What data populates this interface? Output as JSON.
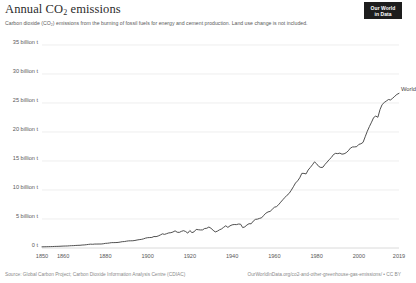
{
  "header": {
    "title_main": "Annual CO",
    "title_sub": "2",
    "title_tail": " emissions",
    "subtitle": "Carbon dioxide (CO₂) emissions from the burning of fossil fuels for energy and cement production. Land use change is not included."
  },
  "logo": {
    "line1": "Our World",
    "line2": "in Data",
    "background": "#1d1d1d",
    "text_color": "#ffffff"
  },
  "footer": {
    "source": "Source: Global Carbon Project; Carbon Dioxide Information Analysis Centre (CDIAC)",
    "url": "OurWorldInData.org/co2-and-other-greenhouse-gas-emissions/ • CC BY"
  },
  "series_label": "World",
  "colors": {
    "line": "#3c3c3c",
    "gridline": "#e6e6e6",
    "axis_text": "#595959",
    "title_text": "#2b2b2b",
    "subtitle_text": "#5b5b5b",
    "footer_text": "#8a8a8a",
    "background": "#ffffff"
  },
  "chart_data": {
    "type": "line",
    "title": "Annual CO2 emissions",
    "subtitle": "Carbon dioxide (CO₂) emissions from the burning of fossil fuels for energy and cement production. Land use change is not included.",
    "xlabel": "",
    "ylabel": "",
    "xlim": [
      1850,
      2019
    ],
    "ylim": [
      0,
      37
    ],
    "grid": true,
    "legend_position": "end-of-line",
    "y_ticks": [
      0,
      5,
      10,
      15,
      20,
      25,
      30,
      35
    ],
    "y_tick_labels": [
      "0 t",
      "5 billion t",
      "10 billion t",
      "15 billion t",
      "20 billion t",
      "25 billion t",
      "30 billion t",
      "35 billion t"
    ],
    "x_ticks": [
      1850,
      1860,
      1880,
      1900,
      1920,
      1940,
      1960,
      1980,
      2000,
      2019
    ],
    "x_tick_labels": [
      "1850",
      "1860",
      "1880",
      "1900",
      "1920",
      "1940",
      "1960",
      "1980",
      "2000",
      "2019"
    ],
    "unit": "billion tonnes",
    "series": [
      {
        "name": "World",
        "color": "#3c3c3c",
        "x": [
          1850,
          1851,
          1852,
          1853,
          1854,
          1855,
          1856,
          1857,
          1858,
          1859,
          1860,
          1861,
          1862,
          1863,
          1864,
          1865,
          1866,
          1867,
          1868,
          1869,
          1870,
          1871,
          1872,
          1873,
          1874,
          1875,
          1876,
          1877,
          1878,
          1879,
          1880,
          1881,
          1882,
          1883,
          1884,
          1885,
          1886,
          1887,
          1888,
          1889,
          1890,
          1891,
          1892,
          1893,
          1894,
          1895,
          1896,
          1897,
          1898,
          1899,
          1900,
          1901,
          1902,
          1903,
          1904,
          1905,
          1906,
          1907,
          1908,
          1909,
          1910,
          1911,
          1912,
          1913,
          1914,
          1915,
          1916,
          1917,
          1918,
          1919,
          1920,
          1921,
          1922,
          1923,
          1924,
          1925,
          1926,
          1927,
          1928,
          1929,
          1930,
          1931,
          1932,
          1933,
          1934,
          1935,
          1936,
          1937,
          1938,
          1939,
          1940,
          1941,
          1942,
          1943,
          1944,
          1945,
          1946,
          1947,
          1948,
          1949,
          1950,
          1951,
          1952,
          1953,
          1954,
          1955,
          1956,
          1957,
          1958,
          1959,
          1960,
          1961,
          1962,
          1963,
          1964,
          1965,
          1966,
          1967,
          1968,
          1969,
          1970,
          1971,
          1972,
          1973,
          1974,
          1975,
          1976,
          1977,
          1978,
          1979,
          1980,
          1981,
          1982,
          1983,
          1984,
          1985,
          1986,
          1987,
          1988,
          1989,
          1990,
          1991,
          1992,
          1993,
          1994,
          1995,
          1996,
          1997,
          1998,
          1999,
          2000,
          2001,
          2002,
          2003,
          2004,
          2005,
          2006,
          2007,
          2008,
          2009,
          2010,
          2011,
          2012,
          2013,
          2014,
          2015,
          2016,
          2017,
          2018,
          2019
        ],
        "values": [
          0.2,
          0.21,
          0.22,
          0.23,
          0.24,
          0.25,
          0.27,
          0.28,
          0.29,
          0.31,
          0.33,
          0.34,
          0.35,
          0.38,
          0.4,
          0.41,
          0.44,
          0.46,
          0.47,
          0.51,
          0.53,
          0.57,
          0.62,
          0.66,
          0.64,
          0.68,
          0.68,
          0.69,
          0.69,
          0.73,
          0.8,
          0.82,
          0.87,
          0.93,
          0.93,
          0.94,
          0.96,
          1.02,
          1.09,
          1.11,
          1.18,
          1.23,
          1.24,
          1.25,
          1.3,
          1.38,
          1.44,
          1.48,
          1.57,
          1.7,
          1.78,
          1.8,
          1.82,
          1.98,
          1.96,
          2.07,
          2.24,
          2.44,
          2.35,
          2.47,
          2.6,
          2.64,
          2.76,
          2.96,
          2.72,
          2.69,
          2.87,
          2.99,
          2.84,
          2.56,
          3.01,
          2.65,
          2.79,
          3.21,
          3.15,
          3.11,
          3.12,
          3.36,
          3.4,
          3.62,
          3.4,
          3.06,
          2.77,
          2.9,
          3.13,
          3.29,
          3.57,
          3.83,
          3.55,
          3.82,
          3.99,
          4.05,
          4.03,
          4.13,
          4.11,
          3.52,
          3.64,
          3.96,
          4.19,
          4.17,
          4.63,
          4.93,
          4.98,
          5.11,
          5.22,
          5.64,
          6.0,
          6.22,
          6.31,
          6.67,
          7.02,
          7.13,
          7.46,
          7.9,
          8.32,
          8.72,
          9.1,
          9.41,
          9.96,
          10.56,
          11.2,
          11.57,
          12.1,
          12.87,
          12.86,
          12.77,
          13.45,
          13.88,
          14.34,
          14.85,
          14.52,
          14.06,
          13.88,
          13.93,
          14.43,
          14.82,
          15.26,
          15.61,
          16.12,
          16.32,
          16.27,
          16.36,
          16.18,
          16.24,
          16.43,
          16.76,
          17.22,
          17.42,
          17.43,
          17.48,
          17.87,
          17.97,
          18.22,
          19.18,
          20.13,
          20.95,
          21.69,
          22.49,
          22.75,
          22.54,
          23.85,
          24.72,
          25.08,
          25.34,
          25.6,
          25.53,
          25.82,
          26.16,
          26.48,
          26.67
        ]
      }
    ],
    "annotations": [
      {
        "text": "World",
        "x": 2019,
        "y": 36.4,
        "type": "series-end-label"
      }
    ]
  }
}
